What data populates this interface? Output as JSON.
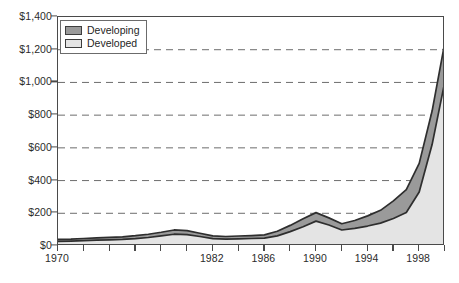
{
  "chart_data": {
    "type": "area",
    "stacked": true,
    "title": "",
    "subtitle": "",
    "xlabel": "",
    "ylabel": "",
    "xlim": [
      1970,
      2000
    ],
    "ylim": [
      0,
      1400
    ],
    "grid": true,
    "grid_style": "dashed-horizontal",
    "legend_position": "upper-left-inside",
    "y_tick_labels": [
      "$0",
      "$200",
      "$400",
      "$600",
      "$800",
      "$1,000",
      "$1,200",
      "$1,400"
    ],
    "y_tick_values": [
      0,
      200,
      400,
      600,
      800,
      1000,
      1200,
      1400
    ],
    "x_tick_labels": [
      "1970",
      "1982",
      "1986",
      "1990",
      "1994",
      "1998"
    ],
    "x_tick_label_values": [
      1970,
      1982,
      1986,
      1990,
      1994,
      1998
    ],
    "x_minor_tick_values": [
      1970,
      1972,
      1974,
      1976,
      1978,
      1980,
      1982,
      1984,
      1986,
      1988,
      1990,
      1992,
      1994,
      1996,
      1998,
      2000
    ],
    "x": [
      1970,
      1971,
      1972,
      1973,
      1974,
      1975,
      1976,
      1977,
      1978,
      1979,
      1980,
      1981,
      1982,
      1983,
      1984,
      1985,
      1986,
      1987,
      1988,
      1989,
      1990,
      1991,
      1992,
      1993,
      1994,
      1995,
      1996,
      1997,
      1998,
      1999,
      2000
    ],
    "series": [
      {
        "name": "Developed",
        "color": "#e4e4e4",
        "values": [
          28,
          30,
          33,
          36,
          38,
          40,
          45,
          52,
          62,
          72,
          70,
          58,
          45,
          42,
          44,
          46,
          48,
          62,
          88,
          118,
          152,
          128,
          98,
          108,
          122,
          140,
          168,
          205,
          330,
          620,
          1010
        ]
      },
      {
        "name": "Developing",
        "color": "#9a9a9a",
        "values": [
          12,
          12,
          13,
          14,
          15,
          16,
          18,
          20,
          22,
          26,
          24,
          20,
          17,
          16,
          17,
          18,
          20,
          28,
          38,
          48,
          52,
          44,
          38,
          48,
          62,
          78,
          108,
          140,
          175,
          205,
          240
        ]
      }
    ],
    "totals": [
      40,
      42,
      46,
      50,
      53,
      56,
      63,
      72,
      84,
      98,
      94,
      78,
      62,
      58,
      61,
      64,
      68,
      90,
      126,
      166,
      204,
      172,
      136,
      156,
      184,
      218,
      276,
      345,
      505,
      825,
      1250
    ]
  },
  "legend": {
    "items": [
      {
        "label": "Developing",
        "swatch_color": "#9a9a9a"
      },
      {
        "label": "Developed",
        "swatch_color": "#e4e4e4"
      }
    ]
  },
  "caption": {
    "text": ""
  },
  "colors": {
    "developing_fill": "#9a9a9a",
    "developed_fill": "#e4e4e4",
    "outline": "#2e2e2e",
    "axis": "#4a4a4a",
    "gridline": "#6d6d6d",
    "text": "#2b2b2b",
    "background": "#ffffff"
  }
}
